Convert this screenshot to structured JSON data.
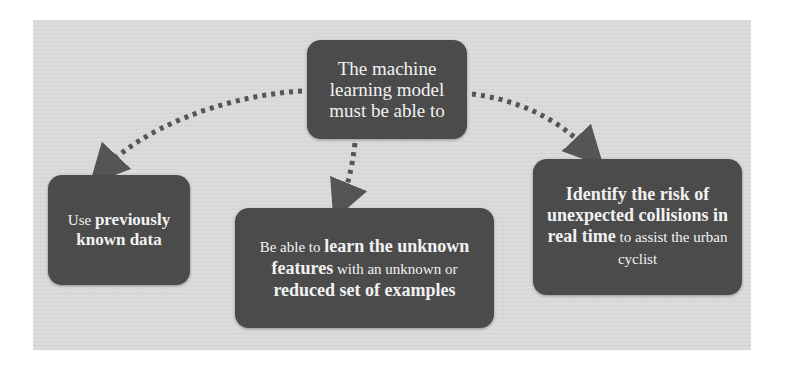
{
  "diagram": {
    "type": "hierarchy",
    "colors": {
      "panel_bg": "#dadada",
      "box_fill": "#4b4b4b",
      "box_text": "#f2f2f2",
      "arrow": "#555555"
    },
    "root": {
      "text": "The machine learning model must be able to"
    },
    "children": [
      {
        "id": "left",
        "segments": [
          {
            "text": "Use ",
            "bold": false
          },
          {
            "text": "previously known data",
            "bold": true
          }
        ]
      },
      {
        "id": "middle",
        "segments": [
          {
            "text": "Be able to ",
            "bold": false
          },
          {
            "text": "learn the unknown features",
            "bold": true
          },
          {
            "text": " with an unknown or ",
            "bold": false
          },
          {
            "text": "reduced set of examples",
            "bold": true
          }
        ]
      },
      {
        "id": "right",
        "segments": [
          {
            "text": "Identify the risk of unexpected collisions in real time",
            "bold": true
          },
          {
            "text": " to assist the urban cyclist",
            "bold": false
          }
        ]
      }
    ],
    "edges": [
      {
        "from": "root",
        "to": "left",
        "style": "dotted-arrow"
      },
      {
        "from": "root",
        "to": "middle",
        "style": "dotted-arrow"
      },
      {
        "from": "root",
        "to": "right",
        "style": "dotted-arrow"
      }
    ]
  }
}
